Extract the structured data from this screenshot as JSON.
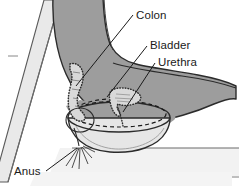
{
  "figure": {
    "type": "anatomical-diagram",
    "background_color": "#ffffff",
    "border_color": "#000000"
  },
  "labels": [
    {
      "id": "colon",
      "text": "Colon",
      "x": 136,
      "y": 19,
      "anchor": "start"
    },
    {
      "id": "bladder",
      "text": "Bladder",
      "x": 150,
      "y": 49,
      "anchor": "start"
    },
    {
      "id": "urethra",
      "text": "Urethra",
      "x": 158,
      "y": 66,
      "anchor": "start"
    },
    {
      "id": "anus",
      "text": "Anus",
      "x": 14,
      "y": 175,
      "anchor": "start"
    }
  ],
  "leader_lines": [
    {
      "id": "colon-leader",
      "from_x": 133,
      "from_y": 15,
      "to_x": 76,
      "to_y": 86
    },
    {
      "id": "bladder-leader",
      "from_x": 147,
      "from_y": 46,
      "to_x": 107,
      "to_y": 97
    },
    {
      "id": "urethra-leader",
      "from_x": 155,
      "from_y": 63,
      "to_x": 123,
      "to_y": 112
    },
    {
      "id": "anus-leader",
      "from_x": 46,
      "from_y": 171,
      "to_x": 77,
      "to_y": 148
    }
  ],
  "structures": [
    {
      "id": "chair-back",
      "name": "chair-backrest",
      "fill": "#e9e9e9",
      "stroke": "#4a4a4a"
    },
    {
      "id": "body",
      "name": "body-silhouette",
      "fill": "#9d9d9d",
      "stroke": "#2b2b2b"
    },
    {
      "id": "colon-organ",
      "name": "colon",
      "fill": "#d8d8d8",
      "stroke": "#3a3a3a",
      "border_style": "stippled"
    },
    {
      "id": "bladder-organ",
      "name": "bladder",
      "fill": "#d8d8d8",
      "stroke": "#3a3a3a",
      "border_style": "stippled"
    },
    {
      "id": "urethra-organ",
      "name": "urethra",
      "fill": "#d8d8d8",
      "stroke": "#3a3a3a",
      "border_style": "stippled"
    },
    {
      "id": "bedpan",
      "name": "bedpan-bowl",
      "fill": "#e6e6e6",
      "stroke": "#2b2b2b"
    },
    {
      "id": "bedpan-rim",
      "name": "bedpan-rim-hidden",
      "fill": "none",
      "stroke": "#1a1a1a",
      "border_style": "dashed"
    },
    {
      "id": "floor",
      "name": "floor-surface",
      "fill": "#f2f2f2",
      "stroke": "#5a5a5a"
    },
    {
      "id": "anus-lines",
      "name": "anus-radiating-lines",
      "stroke": "#3a3a3a"
    }
  ],
  "colors": {
    "body_gray": "#9d9d9d",
    "chair_light": "#e9e9e9",
    "organ_fill": "#d8d8d8",
    "bowl_fill": "#e6e6e6",
    "floor_fill": "#f2f2f2",
    "outline": "#2b2b2b",
    "text": "#1a1a1a"
  }
}
